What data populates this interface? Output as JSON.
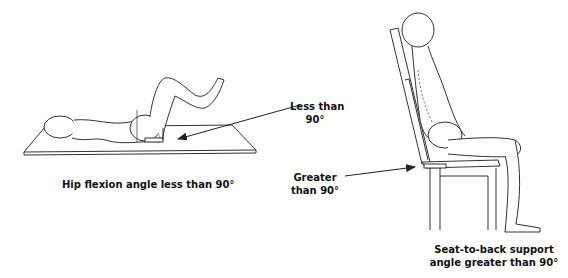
{
  "figure": {
    "left_panel": {
      "caption": "Hip flexion angle less than 90°",
      "callout_line1": "Less than",
      "callout_line2": "90°"
    },
    "right_panel": {
      "caption_line1": "Seat-to-back support",
      "caption_line2": "angle greater than 90°",
      "callout_line1": "Greater",
      "callout_line2": "than 90°"
    },
    "colors": {
      "ink": "#222222",
      "background": "#ffffff"
    }
  }
}
